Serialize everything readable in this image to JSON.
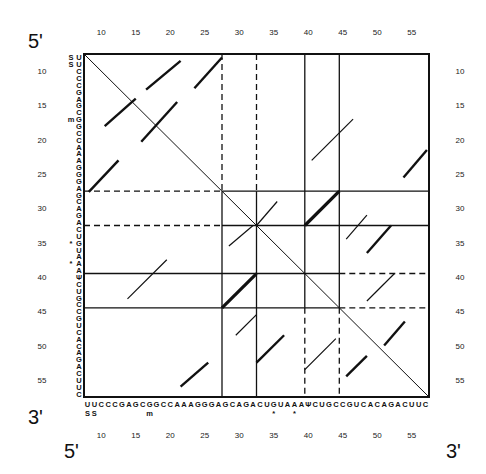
{
  "ends": {
    "top_left": "5'",
    "bottom_left_row": "3'",
    "bottom_left_col": "5'",
    "bottom_right": "3'"
  },
  "axis": {
    "ticks": [
      "10",
      "15",
      "20",
      "25",
      "30",
      "35",
      "40",
      "45",
      "50",
      "55"
    ],
    "tick_positions": [
      10,
      15,
      20,
      25,
      30,
      35,
      40,
      45,
      50,
      55
    ],
    "start": 8,
    "end": 57
  },
  "sequence": {
    "bases": [
      "U",
      "U",
      "C",
      "C",
      "C",
      "G",
      "A",
      "G",
      "C",
      "G",
      "G",
      "C",
      "C",
      "A",
      "A",
      "A",
      "G",
      "G",
      "G",
      "A",
      "G",
      "C",
      "A",
      "G",
      "A",
      "C",
      "U",
      "G",
      "U",
      "A",
      "A",
      "A",
      "Ψ",
      "C",
      "U",
      "G",
      "C",
      "C",
      "G",
      "U",
      "C",
      "A",
      "C",
      "A",
      "G",
      "A",
      "C",
      "U",
      "U",
      "C"
    ],
    "modifications": [
      {
        "pos": 8,
        "mark": "S"
      },
      {
        "pos": 9,
        "mark": "S"
      },
      {
        "pos": 17,
        "mark": "m"
      },
      {
        "pos": 35,
        "mark": "*"
      },
      {
        "pos": 38,
        "mark": "*"
      }
    ]
  },
  "frame": {
    "x0": 84,
    "y0": 54,
    "x1": 429,
    "y1": 397
  },
  "boundaries": {
    "vertical": [
      {
        "pos": 27.5,
        "style": "dashed",
        "y_from": 7.5,
        "y_to": 27.5
      },
      {
        "pos": 27.5,
        "style": "solid",
        "y_from": 27.5,
        "y_to": 57.5
      },
      {
        "pos": 32.5,
        "style": "dashed",
        "y_from": 7.5,
        "y_to": 27.5
      },
      {
        "pos": 32.5,
        "style": "solid",
        "y_from": 27.5,
        "y_to": 57.5
      },
      {
        "pos": 39.5,
        "style": "solid",
        "y_from": 7.5,
        "y_to": 44.5
      },
      {
        "pos": 39.5,
        "style": "dashed",
        "y_from": 44.5,
        "y_to": 57.5
      },
      {
        "pos": 44.5,
        "style": "solid",
        "y_from": 7.5,
        "y_to": 44.5
      },
      {
        "pos": 44.5,
        "style": "dashed",
        "y_from": 44.5,
        "y_to": 57.5
      }
    ],
    "horizontal": [
      {
        "pos": 27.5,
        "style": "dashed",
        "x_from": 7.5,
        "x_to": 27.5
      },
      {
        "pos": 27.5,
        "style": "solid",
        "x_from": 27.5,
        "x_to": 57.5
      },
      {
        "pos": 32.5,
        "style": "dashed",
        "x_from": 7.5,
        "x_to": 27.5
      },
      {
        "pos": 32.5,
        "style": "solid",
        "x_from": 27.5,
        "x_to": 57.5
      },
      {
        "pos": 39.5,
        "style": "solid",
        "x_from": 7.5,
        "x_to": 44.5
      },
      {
        "pos": 39.5,
        "style": "dashed",
        "x_from": 44.5,
        "x_to": 57.5
      },
      {
        "pos": 44.5,
        "style": "solid",
        "x_from": 7.5,
        "x_to": 44.5
      },
      {
        "pos": 44.5,
        "style": "dashed",
        "x_from": 44.5,
        "x_to": 57.5
      }
    ]
  },
  "segments": [
    {
      "x1": 8.2,
      "y1": 27.6,
      "x2": 12.5,
      "y2": 23.0,
      "w": 2.4
    },
    {
      "x1": 16.5,
      "y1": 12.7,
      "x2": 21.5,
      "y2": 8.5,
      "w": 2.4
    },
    {
      "x1": 10.5,
      "y1": 18.0,
      "x2": 15.0,
      "y2": 14.0,
      "w": 2.4
    },
    {
      "x1": 15.8,
      "y1": 20.3,
      "x2": 21.0,
      "y2": 14.5,
      "w": 2.4
    },
    {
      "x1": 23.5,
      "y1": 12.5,
      "x2": 27.5,
      "y2": 8.0,
      "w": 2.4
    },
    {
      "x1": 13.8,
      "y1": 43.2,
      "x2": 19.5,
      "y2": 37.5,
      "w": 1.2
    },
    {
      "x1": 21.5,
      "y1": 56.0,
      "x2": 25.5,
      "y2": 52.5,
      "w": 2.4
    },
    {
      "x1": 27.5,
      "y1": 44.5,
      "x2": 32.5,
      "y2": 39.5,
      "w": 3.2
    },
    {
      "x1": 28.5,
      "y1": 35.5,
      "x2": 32.0,
      "y2": 32.5,
      "w": 1.2
    },
    {
      "x1": 32.5,
      "y1": 32.5,
      "x2": 35.5,
      "y2": 29.0,
      "w": 1.2
    },
    {
      "x1": 39.5,
      "y1": 32.5,
      "x2": 44.5,
      "y2": 27.5,
      "w": 3.2
    },
    {
      "x1": 40.5,
      "y1": 23.0,
      "x2": 46.5,
      "y2": 17.0,
      "w": 1.2
    },
    {
      "x1": 53.8,
      "y1": 25.5,
      "x2": 57.2,
      "y2": 21.5,
      "w": 2.4
    },
    {
      "x1": 45.5,
      "y1": 34.5,
      "x2": 48.5,
      "y2": 31.0,
      "w": 1.2
    },
    {
      "x1": 48.5,
      "y1": 36.5,
      "x2": 52.0,
      "y2": 32.5,
      "w": 2.4
    },
    {
      "x1": 48.5,
      "y1": 43.5,
      "x2": 52.5,
      "y2": 39.5,
      "w": 1.2
    },
    {
      "x1": 29.5,
      "y1": 48.5,
      "x2": 32.5,
      "y2": 45.5,
      "w": 1.2
    },
    {
      "x1": 32.5,
      "y1": 52.5,
      "x2": 36.5,
      "y2": 48.5,
      "w": 2.4
    },
    {
      "x1": 39.5,
      "y1": 53.5,
      "x2": 44.0,
      "y2": 49.0,
      "w": 1.2
    },
    {
      "x1": 45.5,
      "y1": 54.5,
      "x2": 48.5,
      "y2": 51.5,
      "w": 2.4
    },
    {
      "x1": 51.0,
      "y1": 50.0,
      "x2": 54.0,
      "y2": 46.5,
      "w": 2.4
    }
  ]
}
